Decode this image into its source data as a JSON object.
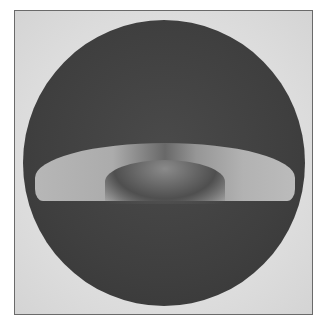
{
  "image": {
    "description": "Halftone scan of a circular dark field with a bright horizontal crescent-shaped band across the middle, inside a thin rectangular frame",
    "colors": {
      "background": "#ffffff",
      "frame_fill": "#dcdcdc",
      "frame_border": "#6a6a6a",
      "disc": "#404040",
      "band": "#b8b8b8"
    }
  }
}
